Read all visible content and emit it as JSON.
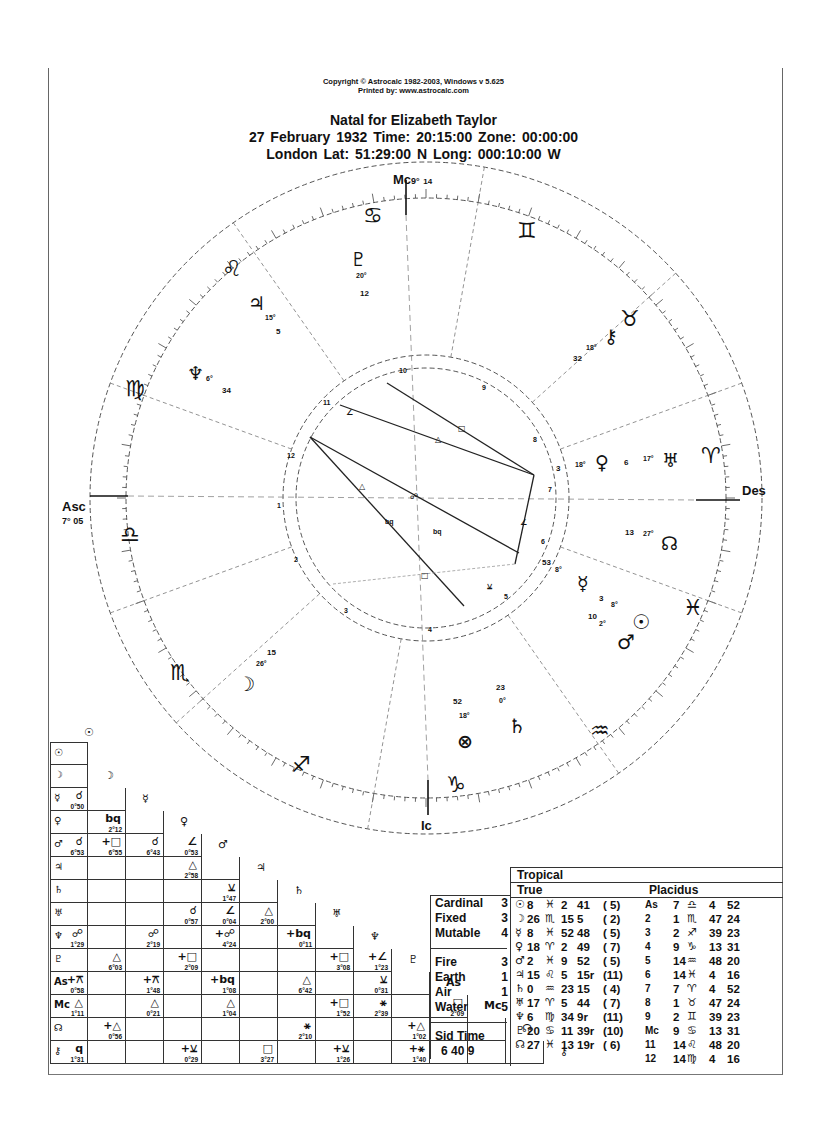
{
  "header": {
    "copyright": "Copyright © Astrocalc 1982-2003, Windows v 5.625",
    "printed_by": "Printed by: www.astrocalc.com",
    "title": "Natal for Elizabeth Taylor",
    "date_line": "27 February 1932   Time: 20:15:00   Zone: 00:00:00",
    "place_line": "London    Lat: 51:29:00 N  Long: 000:10:00 W"
  },
  "wheel": {
    "angles": {
      "mc": {
        "label": "Mc",
        "deg": "9°",
        "min": "14"
      },
      "asc": {
        "label": "Asc",
        "deg": "7°",
        "min": "05"
      },
      "des": {
        "label": "Des"
      },
      "ic": {
        "label": "Ic"
      }
    },
    "signs": [
      {
        "name": "cancer",
        "glyph": "♋"
      },
      {
        "name": "gemini",
        "glyph": "♊"
      },
      {
        "name": "taurus",
        "glyph": "♉"
      },
      {
        "name": "aries",
        "glyph": "♈"
      },
      {
        "name": "pisces",
        "glyph": "♓"
      },
      {
        "name": "aquarius",
        "glyph": "♒"
      },
      {
        "name": "capricorn",
        "glyph": "♑"
      },
      {
        "name": "sagittarius",
        "glyph": "♐"
      },
      {
        "name": "scorpio",
        "glyph": "♏"
      },
      {
        "name": "libra",
        "glyph": "♎"
      },
      {
        "name": "virgo",
        "glyph": "♍"
      },
      {
        "name": "leo",
        "glyph": "♌"
      }
    ],
    "planets": [
      {
        "name": "pluto",
        "glyph": "♇",
        "deg": "20°",
        "min": "12"
      },
      {
        "name": "jupiter",
        "glyph": "♃",
        "deg": "15°",
        "min": "5"
      },
      {
        "name": "neptune",
        "glyph": "♆",
        "deg": "6°",
        "min": "34"
      },
      {
        "name": "chiron",
        "glyph": "⚷",
        "deg": "18°",
        "min": "32"
      },
      {
        "name": "venus",
        "glyph": "♀",
        "deg": "18°",
        "min": "3"
      },
      {
        "name": "uranus",
        "glyph": "♅",
        "deg": "17°",
        "min": "6"
      },
      {
        "name": "node",
        "glyph": "☊",
        "deg": "27°",
        "min": "13"
      },
      {
        "name": "mercury",
        "glyph": "☿",
        "deg": "8°",
        "min": "53"
      },
      {
        "name": "sun",
        "glyph": "☉",
        "deg": "8°",
        "min": "3"
      },
      {
        "name": "mars",
        "glyph": "♂",
        "deg": "2°",
        "min": "10"
      },
      {
        "name": "saturn",
        "glyph": "♄",
        "deg": "0°",
        "min": "23"
      },
      {
        "name": "fortune",
        "glyph": "⊗",
        "deg": "18°",
        "min": "52"
      },
      {
        "name": "moon",
        "glyph": "☽",
        "deg": "26°",
        "min": "15"
      }
    ],
    "house_numbers": [
      "1",
      "2",
      "3",
      "4",
      "5",
      "6",
      "7",
      "8",
      "9",
      "10",
      "11",
      "12"
    ],
    "aspect_labels": [
      "□",
      "△",
      "∠",
      "☍",
      "bq",
      "△",
      "bq",
      "□",
      "⚺",
      "∠"
    ]
  },
  "aspect_grid": {
    "columns": [
      "☉",
      "☽",
      "☿",
      "♀",
      "♂",
      "♃",
      "♄",
      "♅",
      "♆",
      "♇",
      "As",
      "Mc",
      "☊",
      "⚷"
    ],
    "rows": [
      {
        "head": "☉",
        "cells": []
      },
      {
        "head": "☽",
        "cells": []
      },
      {
        "head": "☿",
        "cells": [
          {
            "col": 0,
            "a": "☌",
            "o": "0°50"
          }
        ]
      },
      {
        "head": "♀",
        "cells": [
          {
            "col": 1,
            "a": "bq",
            "o": "2°12"
          }
        ]
      },
      {
        "head": "♂",
        "cells": [
          {
            "col": 0,
            "a": "☌",
            "o": "6°53"
          },
          {
            "col": 1,
            "a": "+□",
            "o": "6°55"
          },
          {
            "col": 2,
            "a": "☌",
            "o": "6°43"
          },
          {
            "col": 3,
            "a": "∠",
            "o": "0°53"
          }
        ]
      },
      {
        "head": "♃",
        "cells": [
          {
            "col": 3,
            "a": "△",
            "o": "2°58"
          }
        ]
      },
      {
        "head": "♄",
        "cells": [
          {
            "col": 4,
            "a": "⚺",
            "o": "1°47"
          }
        ]
      },
      {
        "head": "♅",
        "cells": [
          {
            "col": 3,
            "a": "☌",
            "o": "0°57"
          },
          {
            "col": 4,
            "a": "∠",
            "o": "0°04"
          },
          {
            "col": 5,
            "a": "△",
            "o": "2°00"
          }
        ]
      },
      {
        "head": "♆",
        "cells": [
          {
            "col": 0,
            "a": "☍",
            "o": "1°29"
          },
          {
            "col": 2,
            "a": "☍",
            "o": "2°19"
          },
          {
            "col": 4,
            "a": "+☍",
            "o": "4°24"
          },
          {
            "col": 6,
            "a": "+bq",
            "o": "0°11"
          }
        ]
      },
      {
        "head": "♇",
        "cells": [
          {
            "col": 1,
            "a": "△",
            "o": "6°03"
          },
          {
            "col": 3,
            "a": "+□",
            "o": "2°09"
          },
          {
            "col": 7,
            "a": "+□",
            "o": "3°08"
          },
          {
            "col": 8,
            "a": "+∠",
            "o": "1°23"
          }
        ]
      },
      {
        "head": "As",
        "cells": [
          {
            "col": 0,
            "a": "+⚻",
            "o": "0°58"
          },
          {
            "col": 2,
            "a": "+⚻",
            "o": "1°48"
          },
          {
            "col": 4,
            "a": "+bq",
            "o": "1°08"
          },
          {
            "col": 6,
            "a": "△",
            "o": "6°42"
          },
          {
            "col": 8,
            "a": "⚺",
            "o": "0°31"
          }
        ]
      },
      {
        "head": "Mc",
        "cells": [
          {
            "col": 0,
            "a": "△",
            "o": "1°11"
          },
          {
            "col": 2,
            "a": "△",
            "o": "0°21"
          },
          {
            "col": 4,
            "a": "△",
            "o": "1°04"
          },
          {
            "col": 7,
            "a": "+□",
            "o": "1°52"
          },
          {
            "col": 8,
            "a": "⚹",
            "o": "2°39"
          },
          {
            "col": 10,
            "a": "□",
            "o": "2°09"
          }
        ]
      },
      {
        "head": "☊",
        "cells": [
          {
            "col": 1,
            "a": "+△",
            "o": "0°56"
          },
          {
            "col": 6,
            "a": "⚹",
            "o": "2°10"
          },
          {
            "col": 9,
            "a": "+△",
            "o": "1°02"
          }
        ]
      },
      {
        "head": "⚷",
        "cells": [
          {
            "col": 0,
            "a": "q",
            "o": "1°31"
          },
          {
            "col": 3,
            "a": "+⚺",
            "o": "0°29"
          },
          {
            "col": 5,
            "a": "□",
            "o": "3°27"
          },
          {
            "col": 7,
            "a": "+⚺",
            "o": "1°26"
          },
          {
            "col": 9,
            "a": "+⚹",
            "o": "1°40"
          }
        ]
      }
    ]
  },
  "elements": {
    "modes": [
      {
        "label": "Cardinal",
        "count": "3"
      },
      {
        "label": "Fixed",
        "count": "3"
      },
      {
        "label": "Mutable",
        "count": "4"
      }
    ],
    "elements": [
      {
        "label": "Fire",
        "count": "3"
      },
      {
        "label": "Earth",
        "count": "1"
      },
      {
        "label": "Air",
        "count": "1"
      },
      {
        "label": "Water",
        "count": "5"
      }
    ],
    "sid_time_label": "Sid Time",
    "sid_time_value": "6 40 9"
  },
  "positions": {
    "zodiac_label": "Tropical",
    "node_label": "True",
    "house_system_label": "Placidus",
    "planets": [
      {
        "glyph": "☉",
        "deg": "8",
        "sign": "♓",
        "m": "2",
        "s": "41",
        "house": "( 5)"
      },
      {
        "glyph": "☽",
        "deg": "26",
        "sign": "♏",
        "m": "15",
        "s": "5",
        "house": "( 2)"
      },
      {
        "glyph": "☿",
        "deg": "8",
        "sign": "♓",
        "m": "52",
        "s": "48",
        "house": "( 5)"
      },
      {
        "glyph": "♀",
        "deg": "18",
        "sign": "♈",
        "m": "2",
        "s": "49",
        "house": "( 7)"
      },
      {
        "glyph": "♂",
        "deg": "2",
        "sign": "♓",
        "m": "9",
        "s": "52",
        "house": "( 5)"
      },
      {
        "glyph": "♃",
        "deg": "15",
        "sign": "♌",
        "m": "5",
        "s": "15r",
        "house": "(11)"
      },
      {
        "glyph": "♄",
        "deg": "0",
        "sign": "♒",
        "m": "23",
        "s": "15",
        "house": "( 4)"
      },
      {
        "glyph": "♅",
        "deg": "17",
        "sign": "♈",
        "m": "5",
        "s": "44",
        "house": "( 7)"
      },
      {
        "glyph": "♆",
        "deg": "6",
        "sign": "♍",
        "m": "34",
        "s": "9r",
        "house": "(11)"
      },
      {
        "glyph": "♇",
        "deg": "20",
        "sign": "♋",
        "m": "11",
        "s": "39r",
        "house": "(10)"
      },
      {
        "glyph": "☊",
        "deg": "27",
        "sign": "♓",
        "m": "13",
        "s": "19r",
        "house": "( 6)"
      }
    ],
    "houses": [
      {
        "label": "As",
        "deg": "7",
        "sign": "♎",
        "m": "4",
        "s": "52"
      },
      {
        "label": "2",
        "deg": "1",
        "sign": "♏",
        "m": "47",
        "s": "24"
      },
      {
        "label": "3",
        "deg": "2",
        "sign": "♐",
        "m": "39",
        "s": "23"
      },
      {
        "label": "4",
        "deg": "9",
        "sign": "♑",
        "m": "13",
        "s": "31"
      },
      {
        "label": "5",
        "deg": "14",
        "sign": "♒",
        "m": "48",
        "s": "20"
      },
      {
        "label": "6",
        "deg": "14",
        "sign": "♓",
        "m": "4",
        "s": "16"
      },
      {
        "label": "7",
        "deg": "7",
        "sign": "♈",
        "m": "4",
        "s": "52"
      },
      {
        "label": "8",
        "deg": "1",
        "sign": "♉",
        "m": "47",
        "s": "24"
      },
      {
        "label": "9",
        "deg": "2",
        "sign": "♊",
        "m": "39",
        "s": "23"
      },
      {
        "label": "Mc",
        "deg": "9",
        "sign": "♋",
        "m": "13",
        "s": "31"
      },
      {
        "label": "11",
        "deg": "14",
        "sign": "♌",
        "m": "48",
        "s": "20"
      },
      {
        "label": "12",
        "deg": "14",
        "sign": "♍",
        "m": "4",
        "s": "16"
      }
    ]
  }
}
